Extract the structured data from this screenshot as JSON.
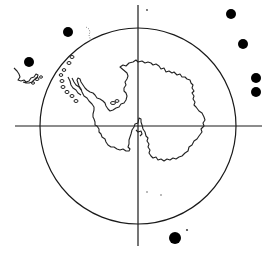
{
  "map": {
    "projection": "south-polar",
    "subject": "Antarctica",
    "colors": {
      "ink": "#1a1a1a",
      "marker": "#000000",
      "background": "#ffffff"
    },
    "frame": {
      "circle": {
        "cx": 138,
        "cy": 126,
        "r": 98
      },
      "horizontal_axis": {
        "x1": 15,
        "x2": 262,
        "y": 126
      },
      "vertical_axis": {
        "x": 138,
        "y1": 5,
        "y2": 246
      }
    },
    "markers": [
      {
        "id": "m1",
        "cx": 68,
        "cy": 32,
        "r": 5
      },
      {
        "id": "m2",
        "cx": 29,
        "cy": 62,
        "r": 5
      },
      {
        "id": "m3",
        "cx": 231,
        "cy": 14,
        "r": 5
      },
      {
        "id": "m4",
        "cx": 243,
        "cy": 44,
        "r": 5
      },
      {
        "id": "m5",
        "cx": 256,
        "cy": 78,
        "r": 5
      },
      {
        "id": "m6",
        "cx": 256,
        "cy": 92,
        "r": 5
      },
      {
        "id": "m7",
        "cx": 175,
        "cy": 238,
        "r": 6
      }
    ],
    "labels": []
  }
}
